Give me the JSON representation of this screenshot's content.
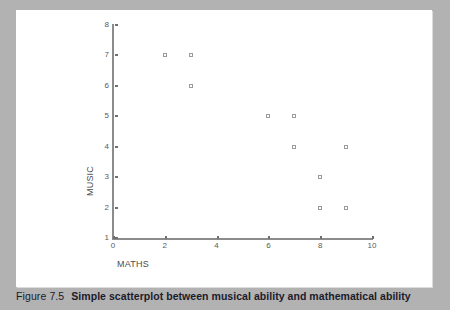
{
  "figure": {
    "caption_number": "Figure 7.5",
    "caption_text": "Simple scatterplot between musical ability and mathematical ability",
    "background_color": "#b2b2b2",
    "panel_color": "#ffffff",
    "caption_color": "#1b1b2b"
  },
  "chart_data": {
    "type": "scatter",
    "title": "",
    "xlabel": "MATHS",
    "ylabel": "MUSIC",
    "xlim": [
      0,
      10
    ],
    "ylim": [
      1,
      8
    ],
    "xticks": [
      0,
      2,
      4,
      6,
      8,
      10
    ],
    "yticks": [
      1,
      2,
      3,
      4,
      5,
      6,
      7,
      8
    ],
    "xtick_labels": [
      "0",
      "2",
      "4",
      "6",
      "8",
      "10"
    ],
    "ytick_labels": [
      "1",
      "2",
      "3",
      "4",
      "5",
      "6",
      "7",
      "8"
    ],
    "grid": false,
    "legend": null,
    "marker": "open-square",
    "marker_color": "#9a9a9a",
    "axis_color": "#8c8c8c",
    "points": [
      {
        "x": 2,
        "y": 7
      },
      {
        "x": 3,
        "y": 7
      },
      {
        "x": 3,
        "y": 6
      },
      {
        "x": 6,
        "y": 5
      },
      {
        "x": 7,
        "y": 5
      },
      {
        "x": 7,
        "y": 4
      },
      {
        "x": 9,
        "y": 4
      },
      {
        "x": 8,
        "y": 3
      },
      {
        "x": 8,
        "y": 2
      },
      {
        "x": 9,
        "y": 2
      }
    ]
  }
}
